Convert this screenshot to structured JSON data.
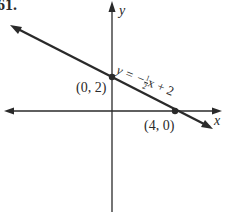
{
  "problem_number": "61.",
  "axes": {
    "x_label": "x",
    "y_label": "y"
  },
  "line": {
    "equation_prefix": "y = −",
    "fraction_num": "1",
    "fraction_den": "2",
    "equation_suffix": "x + 2",
    "slope": -0.5,
    "intercept": 2
  },
  "points": [
    {
      "label": "(0, 2)",
      "x": 0,
      "y": 2
    },
    {
      "label": "(4, 0)",
      "x": 4,
      "y": 0
    }
  ],
  "colors": {
    "ink": "#2a2a2a",
    "background": "#ffffff"
  }
}
